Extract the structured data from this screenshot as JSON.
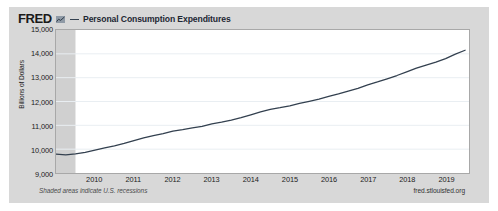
{
  "header": {
    "logo_text": "FRED",
    "logo_mark_icon": "mini-chart-icon",
    "legend_dash_icon": "legend-line-icon",
    "series_label": "Personal Consumption Expenditures"
  },
  "footer": {
    "note": "Shaded areas indicate U.S. recessions",
    "source": "fred.stlouisfed.org"
  },
  "colors": {
    "card_background": "#d8d8d8",
    "plot_background": "#ffffff",
    "line": "#33404f",
    "recession_band": "#d0d0d0",
    "gridline": "#e9eef2",
    "frame_border": "#a8a8a8",
    "text": "#222222"
  },
  "chart_data": {
    "type": "line",
    "title": "Personal Consumption Expenditures",
    "xlabel": "",
    "ylabel": "Billions of Dollars",
    "ylim": [
      9000,
      15000
    ],
    "ytick_labels": [
      "15,000",
      "14,000",
      "13,000",
      "12,000",
      "11,000",
      "10,000",
      "9,000"
    ],
    "ytick_values": [
      15000,
      14000,
      13000,
      12000,
      11000,
      10000,
      9000
    ],
    "xlim": [
      2009.0,
      2019.6
    ],
    "xtick_labels": [
      "2010",
      "2011",
      "2012",
      "2013",
      "2014",
      "2015",
      "2016",
      "2017",
      "2018",
      "2019"
    ],
    "xtick_values": [
      2010,
      2011,
      2012,
      2013,
      2014,
      2015,
      2016,
      2017,
      2018,
      2019
    ],
    "grid": true,
    "legend_position": "top",
    "recession_bands": [
      {
        "start": 2009.0,
        "end": 2009.5
      }
    ],
    "series": [
      {
        "name": "Personal Consumption Expenditures",
        "color": "#33404f",
        "x": [
          2009.0,
          2009.25,
          2009.5,
          2009.75,
          2010.0,
          2010.25,
          2010.5,
          2010.75,
          2011.0,
          2011.25,
          2011.5,
          2011.75,
          2012.0,
          2012.25,
          2012.5,
          2012.75,
          2013.0,
          2013.25,
          2013.5,
          2013.75,
          2014.0,
          2014.25,
          2014.5,
          2014.75,
          2015.0,
          2015.25,
          2015.5,
          2015.75,
          2016.0,
          2016.25,
          2016.5,
          2016.75,
          2017.0,
          2017.25,
          2017.5,
          2017.75,
          2018.0,
          2018.25,
          2018.5,
          2018.75,
          2019.0,
          2019.25,
          2019.5
        ],
        "y": [
          9790,
          9760,
          9800,
          9870,
          9960,
          10050,
          10140,
          10240,
          10360,
          10470,
          10570,
          10650,
          10760,
          10820,
          10890,
          10960,
          11060,
          11130,
          11220,
          11320,
          11440,
          11560,
          11670,
          11740,
          11820,
          11920,
          12010,
          12100,
          12210,
          12320,
          12440,
          12550,
          12700,
          12820,
          12950,
          13090,
          13240,
          13400,
          13530,
          13650,
          13800,
          13990,
          14150
        ]
      }
    ]
  }
}
